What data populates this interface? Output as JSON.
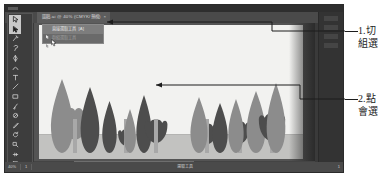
{
  "window": {
    "document_tab": {
      "title": "圖稿.ai @ 40% (CMYK/預視)",
      "close_label": "×"
    }
  },
  "toolbar": {
    "tools": [
      {
        "name": "selection-tool",
        "label": "選取工具"
      },
      {
        "name": "direct-selection-tool",
        "label": "直接選取工具",
        "active": true
      },
      {
        "name": "magic-wand-tool",
        "label": "魔術棒工具"
      },
      {
        "name": "lasso-tool",
        "label": "套索工具"
      },
      {
        "name": "pen-tool",
        "label": "鋼筆工具"
      },
      {
        "name": "curvature-tool",
        "label": "曲率工具"
      },
      {
        "name": "type-tool",
        "label": "文字工具"
      },
      {
        "name": "line-segment-tool",
        "label": "線段工具"
      },
      {
        "name": "rectangle-tool",
        "label": "矩形工具"
      },
      {
        "name": "paintbrush-tool",
        "label": "筆刷工具"
      },
      {
        "name": "shaper-tool",
        "label": "形狀建立器工具"
      },
      {
        "name": "pencil-tool",
        "label": "鉛筆工具"
      },
      {
        "name": "rotate-tool",
        "label": "旋轉工具"
      },
      {
        "name": "scale-tool",
        "label": "縮放工具"
      },
      {
        "name": "width-tool",
        "label": "寬度工具"
      },
      {
        "name": "free-transform-tool",
        "label": "任意變形工具"
      },
      {
        "name": "shape-builder-tool",
        "label": "形狀建立器"
      },
      {
        "name": "perspective-grid-tool",
        "label": "透視格點工具"
      },
      {
        "name": "mesh-tool",
        "label": "網格工具"
      },
      {
        "name": "gradient-tool",
        "label": "漸層工具"
      },
      {
        "name": "eyedropper-tool",
        "label": "滴管工具"
      },
      {
        "name": "blend-tool",
        "label": "漸變工具"
      },
      {
        "name": "symbol-sprayer-tool",
        "label": "符號噴灑器工具"
      },
      {
        "name": "column-graph-tool",
        "label": "長條圖工具"
      },
      {
        "name": "artboard-tool",
        "label": "工作區域工具"
      },
      {
        "name": "slice-tool",
        "label": "切片工具"
      },
      {
        "name": "hand-tool",
        "label": "手形工具"
      },
      {
        "name": "zoom-tool",
        "label": "縮放顯示工具"
      }
    ]
  },
  "flyout_menu": {
    "items": [
      {
        "label": "直接選取工具",
        "shortcut": "[A]",
        "selected": true,
        "dimmed": false
      },
      {
        "label": "群組選取工具",
        "shortcut": "",
        "selected": false,
        "dimmed": true
      }
    ]
  },
  "status_bar": {
    "zoom": "40%",
    "artboard_nav": "1",
    "tool_label": "選取工具",
    "page_field": "1",
    "fields": [
      "40%",
      "1",
      "選取工具",
      "1"
    ]
  },
  "artwork": {
    "title": "鬱金香插圖",
    "colors": {
      "background": "#f2f2f0",
      "ground": "#c2c2c0",
      "dark_shape": "#4d4d4d",
      "mid_shape": "#8c8c8c",
      "light_shape": "#a8a8a8"
    },
    "plants": [
      {
        "name": "tulip-bloom-1",
        "type": "bloom",
        "x": 18,
        "width": 36,
        "height": 46,
        "tone": "mid"
      },
      {
        "name": "leaf-1",
        "type": "leaf",
        "x": 10,
        "width": 26,
        "height": 74,
        "tone": "mid"
      },
      {
        "name": "leaf-2",
        "type": "leaf",
        "x": 40,
        "width": 22,
        "height": 66,
        "tone": "dark"
      },
      {
        "name": "leaf-3",
        "type": "leaf",
        "x": 62,
        "width": 17,
        "height": 52,
        "tone": "dark"
      },
      {
        "name": "tulip-bloom-2",
        "type": "bloom",
        "x": 78,
        "width": 18,
        "height": 24,
        "tone": "dark"
      },
      {
        "name": "leaf-4",
        "type": "leaf",
        "x": 84,
        "width": 14,
        "height": 44,
        "tone": "mid"
      },
      {
        "name": "leaf-5",
        "type": "leaf",
        "x": 96,
        "width": 18,
        "height": 58,
        "tone": "dark"
      },
      {
        "name": "tulip-bloom-3",
        "type": "bloom",
        "x": 104,
        "width": 26,
        "height": 34,
        "tone": "dark"
      },
      {
        "name": "tulip-bloom-4",
        "type": "bloom",
        "x": 156,
        "width": 24,
        "height": 30,
        "tone": "dark"
      },
      {
        "name": "leaf-6",
        "type": "leaf",
        "x": 150,
        "width": 20,
        "height": 56,
        "tone": "mid"
      },
      {
        "name": "leaf-7",
        "type": "leaf",
        "x": 172,
        "width": 18,
        "height": 50,
        "tone": "dark"
      },
      {
        "name": "tulip-bloom-5",
        "type": "bloom",
        "x": 190,
        "width": 22,
        "height": 32,
        "tone": "dark"
      },
      {
        "name": "leaf-8",
        "type": "leaf",
        "x": 188,
        "width": 18,
        "height": 54,
        "tone": "mid"
      },
      {
        "name": "leaf-9",
        "type": "leaf",
        "x": 206,
        "width": 22,
        "height": 62,
        "tone": "mid"
      },
      {
        "name": "tulip-bloom-6",
        "type": "bloom",
        "x": 218,
        "width": 30,
        "height": 40,
        "tone": "dark"
      },
      {
        "name": "leaf-10",
        "type": "leaf",
        "x": 226,
        "width": 22,
        "height": 70,
        "tone": "mid"
      }
    ]
  },
  "annotations": [
    {
      "name": "annotation-1",
      "number": "1.",
      "text": "1.切",
      "line2": "組選"
    },
    {
      "name": "annotation-2",
      "number": "2.",
      "text": "2.點",
      "line2": "會選"
    }
  ]
}
